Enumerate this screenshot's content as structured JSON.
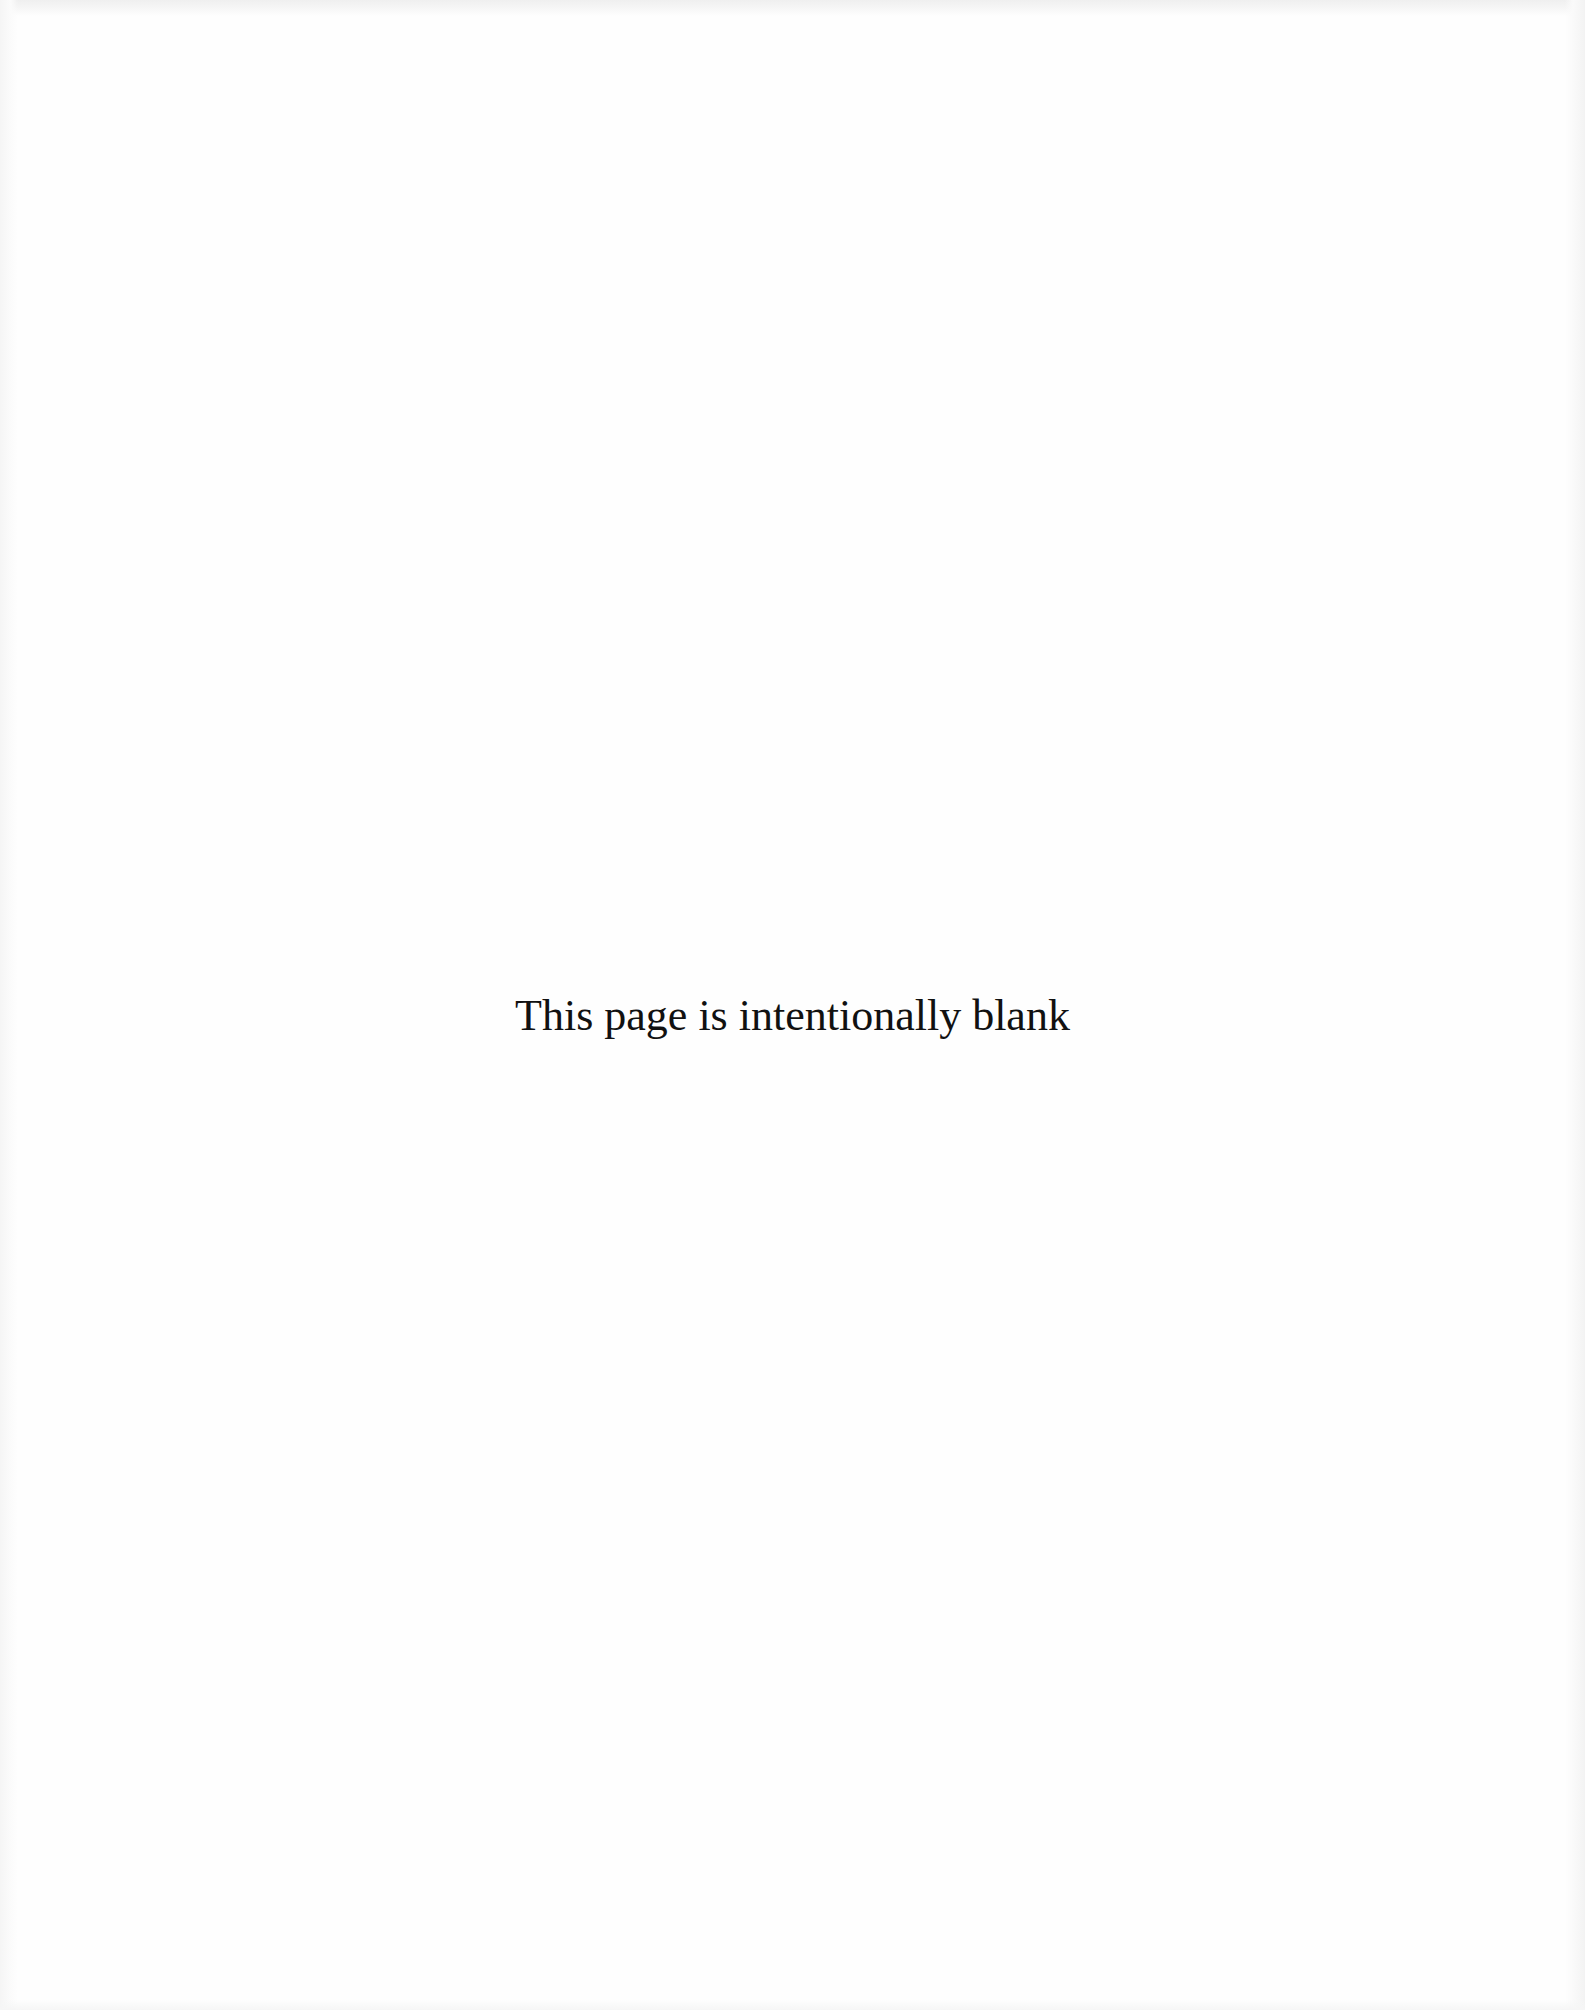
{
  "page": {
    "notice_text": "This page is intentionally blank",
    "background_color": "#fefefe",
    "text_color": "#111111"
  }
}
